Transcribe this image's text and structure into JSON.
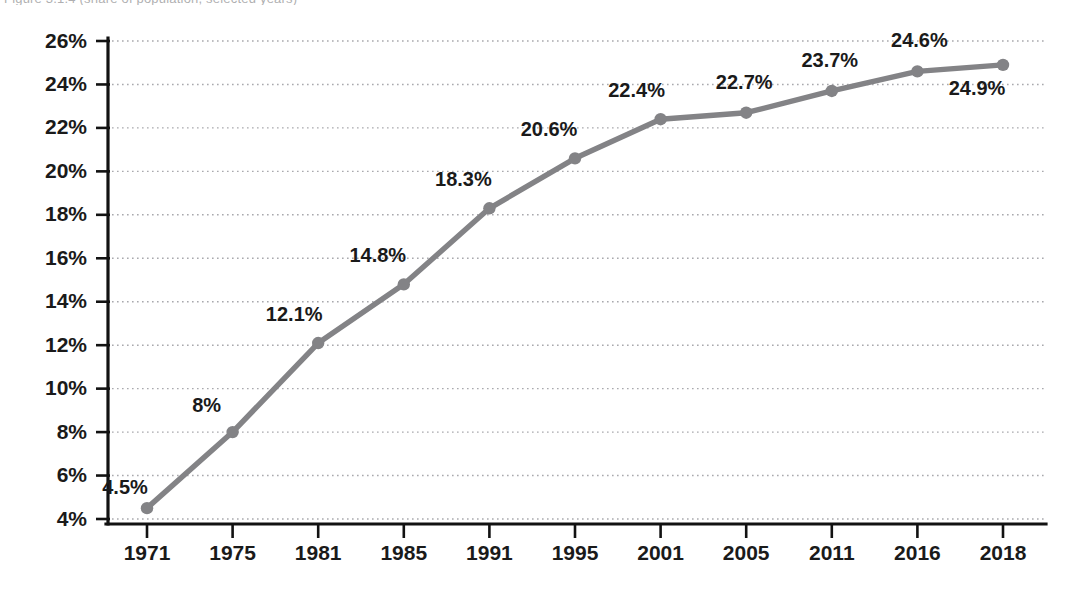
{
  "caption": {
    "text_fragment": "Figure 3.1.4  (share of population, selected years)"
  },
  "chart_data": {
    "type": "line",
    "title": "",
    "subtitle": "",
    "xlabel": "",
    "ylabel": "",
    "categories": [
      "1971",
      "1975",
      "1981",
      "1985",
      "1991",
      "1995",
      "2001",
      "2005",
      "2011",
      "2016",
      "2018"
    ],
    "values": [
      4.5,
      8.0,
      12.1,
      14.8,
      18.3,
      20.6,
      22.4,
      22.7,
      23.7,
      24.6,
      24.9
    ],
    "data_labels": [
      "4.5%",
      "8%",
      "12.1%",
      "14.8%",
      "18.3%",
      "20.6%",
      "22.4%",
      "22.7%",
      "23.7%",
      "24.6%",
      "24.9%"
    ],
    "ytick_labels": [
      "26%",
      "24%",
      "22%",
      "20%",
      "18%",
      "16%",
      "14%",
      "12%",
      "10%",
      "8%",
      "6%",
      "4%"
    ],
    "ytick_values": [
      26,
      24,
      22,
      20,
      18,
      16,
      14,
      12,
      10,
      8,
      6,
      4
    ],
    "ylim": [
      4,
      26
    ],
    "ytick_step": 2,
    "grid": "horizontal-dotted",
    "legend": "none",
    "series": [
      {
        "name": "series-1",
        "color": "#838386",
        "marker": "circle",
        "values": [
          4.5,
          8.0,
          12.1,
          14.8,
          18.3,
          20.6,
          22.4,
          22.7,
          23.7,
          24.6,
          24.9
        ]
      }
    ],
    "label_offsets": [
      {
        "dx": -22,
        "dy": -14,
        "anchor": "middle"
      },
      {
        "dx": -26,
        "dy": -20,
        "anchor": "middle"
      },
      {
        "dx": -24,
        "dy": -22,
        "anchor": "middle"
      },
      {
        "dx": -26,
        "dy": -22,
        "anchor": "middle"
      },
      {
        "dx": -26,
        "dy": -22,
        "anchor": "middle"
      },
      {
        "dx": -26,
        "dy": -22,
        "anchor": "middle"
      },
      {
        "dx": -24,
        "dy": -22,
        "anchor": "middle"
      },
      {
        "dx": -2,
        "dy": -24,
        "anchor": "middle"
      },
      {
        "dx": -2,
        "dy": -24,
        "anchor": "middle"
      },
      {
        "dx": 2,
        "dy": -24,
        "anchor": "middle"
      },
      {
        "dx": -26,
        "dy": 30,
        "anchor": "middle"
      }
    ]
  },
  "colors": {
    "line": "#838386",
    "marker": "#838386",
    "axis": "#121212",
    "grid": "#a9a9ad",
    "text": "#1a1a1a",
    "background": "#ffffff"
  }
}
